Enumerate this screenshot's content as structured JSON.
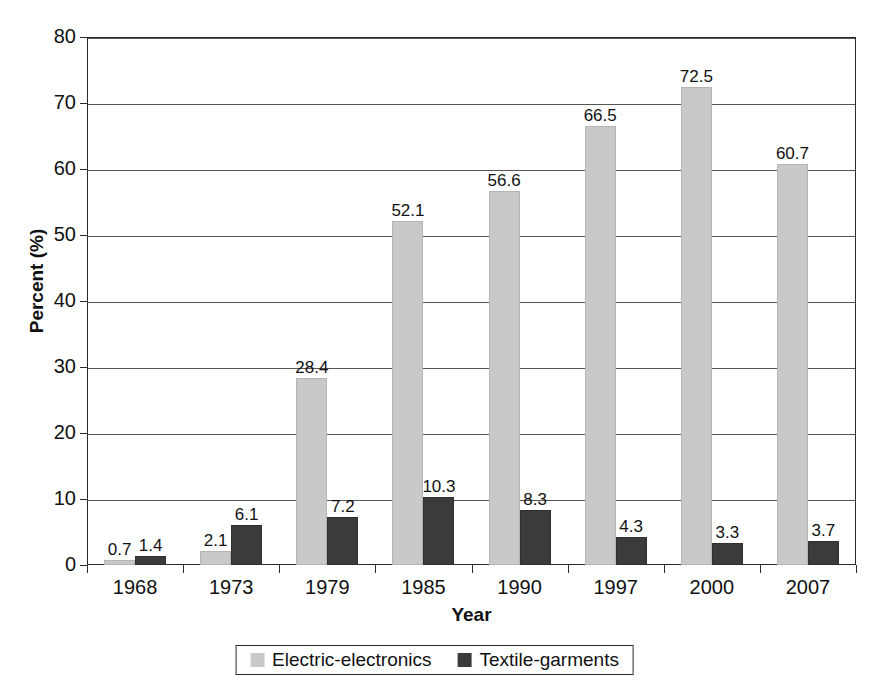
{
  "chart_data": {
    "type": "bar",
    "title": "",
    "xlabel": "Year",
    "ylabel": "Percent (%)",
    "categories": [
      "1968",
      "1973",
      "1979",
      "1985",
      "1990",
      "1997",
      "2000",
      "2007"
    ],
    "series": [
      {
        "name": "Electric-electronics",
        "color": "#c9c9c9",
        "values": [
          0.7,
          2.1,
          28.4,
          52.1,
          56.6,
          66.5,
          72.5,
          60.7
        ]
      },
      {
        "name": "Textile-garments",
        "color": "#3b3b3b",
        "values": [
          1.4,
          6.1,
          7.2,
          10.3,
          8.3,
          4.3,
          3.3,
          3.7
        ]
      }
    ],
    "ylim": [
      0,
      80
    ],
    "yticks": [
      0,
      10,
      20,
      30,
      40,
      50,
      60,
      70,
      80
    ],
    "ytick_labels": [
      "0",
      "10",
      "20",
      "30",
      "40",
      "50",
      "60",
      "70",
      "80"
    ],
    "grid": true,
    "legend_position": "bottom"
  },
  "legend": {
    "items": [
      {
        "label": "Electric-electronics",
        "color": "#c9c9c9"
      },
      {
        "label": "Textile-garments",
        "color": "#3b3b3b"
      }
    ]
  },
  "axes": {
    "x_title": "Year",
    "y_title": "Percent (%)"
  }
}
